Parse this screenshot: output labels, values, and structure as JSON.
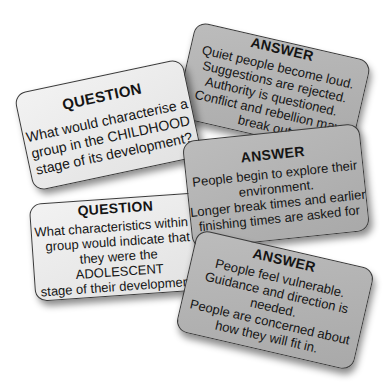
{
  "cards": {
    "question_childhood": {
      "heading": "QUESTION",
      "lines": [
        "What would characterise a",
        "group in the CHILDHOOD",
        "stage of its development?"
      ],
      "color": "#e8e8e8"
    },
    "answer_childhood": {
      "heading": "ANSWER",
      "lines": [
        "Quiet people become loud.",
        "Suggestions are rejected.",
        "Authority is questioned.",
        "Conflict and rebellion may",
        "break out"
      ],
      "color": "#b3b3b3"
    },
    "answer_explore": {
      "heading": "ANSWER",
      "lines": [
        "People begin to explore their",
        "environment.",
        "Longer break times and earlier",
        "finishing times are asked for"
      ],
      "color": "#b3b3b3"
    },
    "question_adolescent": {
      "heading": "QUESTION",
      "lines": [
        "What characteristics within a",
        "group would indicate that",
        "they were the",
        "ADOLESCENT",
        "stage of their  development?"
      ],
      "color": "#e8e8e8"
    },
    "answer_vulnerable": {
      "heading": "ANSWER",
      "lines": [
        "People feel vulnerable.",
        "Guidance and direction is",
        "needed.",
        "People are concerned about",
        "how they will fit in."
      ],
      "color": "#b3b3b3"
    }
  }
}
